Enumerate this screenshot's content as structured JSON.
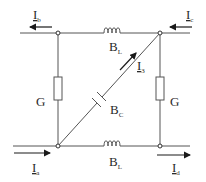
{
  "diagram": {
    "type": "circuit",
    "colors": {
      "line": "#4a4a4a",
      "text": "#2a2a2a",
      "background": "#ffffff"
    },
    "currents": {
      "a": {
        "main": "I",
        "sub": "a",
        "direction": "right"
      },
      "b": {
        "main": "I",
        "sub": "b",
        "direction": "left"
      },
      "c": {
        "main": "I",
        "sub": "c",
        "direction": "left"
      },
      "d": {
        "main": "I",
        "sub": "d",
        "direction": "right"
      },
      "three": {
        "main": "I",
        "sub": "3",
        "direction": "up-right"
      }
    },
    "components": {
      "inductor_top": {
        "main": "B",
        "sub": "L"
      },
      "inductor_bottom": {
        "main": "B",
        "sub": "L"
      },
      "capacitor": {
        "main": "B",
        "sub": "C"
      },
      "resistor_left": {
        "main": "G"
      },
      "resistor_right": {
        "main": "G"
      }
    }
  }
}
